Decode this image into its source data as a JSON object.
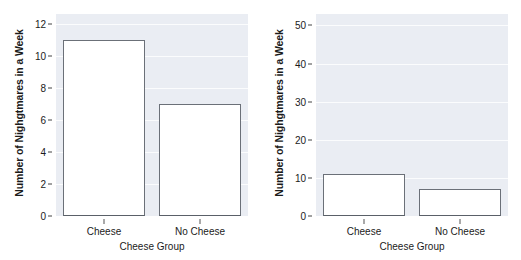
{
  "figure": {
    "panel_background": "#eaedf3",
    "bar_fill": "#ffffff",
    "bar_border": "#6b7078",
    "gridline_color": "#fbfcfd",
    "text_color": "#1b1b1b"
  },
  "chart_data": [
    {
      "type": "bar",
      "title": "",
      "categories": [
        "Cheese",
        "No Cheese"
      ],
      "values": [
        11,
        7
      ],
      "xlabel": "Cheese Group",
      "ylabel": "Number of Nighgtmares in a Week",
      "ylim": [
        0,
        12.6
      ],
      "yticks": [
        0,
        2,
        4,
        6,
        8,
        10,
        12
      ],
      "ytick_labels": [
        "0",
        "2",
        "4",
        "6",
        "8",
        "10",
        "12"
      ],
      "grid": true,
      "legend": "none"
    },
    {
      "type": "bar",
      "title": "",
      "categories": [
        "Cheese",
        "No Cheese"
      ],
      "values": [
        11,
        7
      ],
      "xlabel": "Cheese Group",
      "ylabel": "Number of Nighgtmares in a Week",
      "ylim": [
        0,
        53
      ],
      "yticks": [
        0,
        10,
        20,
        30,
        40,
        50
      ],
      "ytick_labels": [
        "0",
        "10",
        "20",
        "30",
        "40",
        "50"
      ],
      "grid": true,
      "legend": "none"
    }
  ]
}
